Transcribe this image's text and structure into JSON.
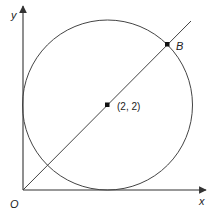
{
  "diagram": {
    "axes": {
      "x_label": "x",
      "y_label": "y",
      "origin_label": "O"
    },
    "circle": {
      "center_label": "(2, 2)",
      "center": [
        2,
        2
      ],
      "radius": 2,
      "tangent_to": [
        "x-axis",
        "y-axis"
      ]
    },
    "line": {
      "passes_through": [
        "O",
        "(2, 2)",
        "B"
      ]
    },
    "points": {
      "B_label": "B"
    },
    "colors": {
      "stroke": "#333333",
      "point": "#111111"
    }
  }
}
